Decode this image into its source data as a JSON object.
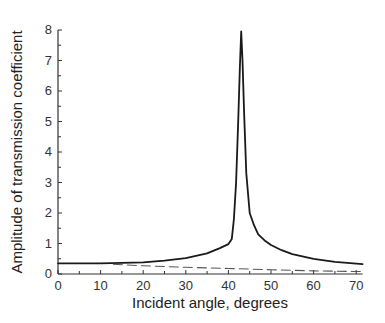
{
  "chart_data": {
    "type": "line",
    "title": "",
    "xlabel": "Incident angle, degrees",
    "ylabel": "Amplitude of transmission coefficient",
    "xlim": [
      0,
      71.5
    ],
    "ylim": [
      0,
      8
    ],
    "xticks": [
      0,
      10,
      20,
      30,
      40,
      50,
      60,
      70
    ],
    "yticks": [
      0,
      1,
      2,
      3,
      4,
      5,
      6,
      7,
      8
    ],
    "grid": false,
    "legend": null,
    "series": [
      {
        "name": "solid",
        "style": "solid",
        "x": [
          0,
          10,
          20,
          25,
          30,
          35,
          38,
          40,
          40.8,
          41.3,
          41.8,
          42.3,
          42.7,
          43.0,
          43.3,
          43.7,
          44.2,
          45.0,
          46.0,
          47.0,
          48.5,
          50.0,
          52.5,
          55.0,
          60.0,
          65.0,
          71.5
        ],
        "y": [
          0.35,
          0.35,
          0.38,
          0.44,
          0.52,
          0.68,
          0.85,
          0.98,
          1.15,
          1.8,
          3.0,
          5.0,
          6.8,
          7.95,
          7.0,
          5.2,
          3.3,
          2.0,
          1.6,
          1.3,
          1.1,
          0.95,
          0.78,
          0.65,
          0.5,
          0.4,
          0.32
        ]
      },
      {
        "name": "dashed",
        "style": "dashed",
        "x": [
          13,
          20,
          30,
          40,
          50,
          60,
          71.5
        ],
        "y": [
          0.32,
          0.27,
          0.22,
          0.18,
          0.14,
          0.1,
          0.08
        ]
      }
    ]
  }
}
